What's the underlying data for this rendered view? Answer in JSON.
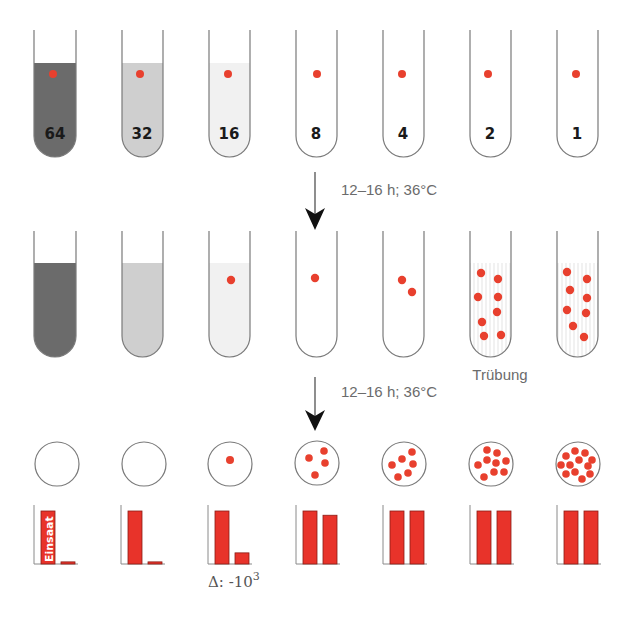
{
  "diagram": {
    "title": "",
    "colors": {
      "bacteria": "#e8402e",
      "bar_fill": "#e8332a",
      "bar_stroke": "#8a1d15",
      "tube_outline": "#7a7a7a",
      "liquid_64": "#6b6b6b",
      "liquid_32": "#cfcfcf",
      "liquid_16": "#f1f1f1",
      "arrow": "#111111",
      "label_grey": "#6b6b6b"
    },
    "row1": {
      "description": "Serial dilution tubes with inoculum (one bacterium each)",
      "tubes": [
        {
          "concentration": "64",
          "liquid": "dark",
          "bacteria": 1
        },
        {
          "concentration": "32",
          "liquid": "medium",
          "bacteria": 1
        },
        {
          "concentration": "16",
          "liquid": "light",
          "bacteria": 1
        },
        {
          "concentration": "8",
          "liquid": "clear",
          "bacteria": 1
        },
        {
          "concentration": "4",
          "liquid": "clear",
          "bacteria": 1
        },
        {
          "concentration": "2",
          "liquid": "clear",
          "bacteria": 1
        },
        {
          "concentration": "1",
          "liquid": "clear",
          "bacteria": 1
        }
      ]
    },
    "arrow1": {
      "label": "12–16 h; 36°C"
    },
    "row2": {
      "description": "Tubes after incubation",
      "tubes": [
        {
          "bacteria": 0,
          "turbid": false
        },
        {
          "bacteria": 0,
          "turbid": false
        },
        {
          "bacteria": 1,
          "turbid": false
        },
        {
          "bacteria": 1,
          "turbid": false
        },
        {
          "bacteria": 2,
          "turbid": false
        },
        {
          "bacteria": 8,
          "turbid": true
        },
        {
          "bacteria": 8,
          "turbid": true
        }
      ],
      "turbidity_label": "Trübung"
    },
    "arrow2": {
      "label": "12–16 h; 36°C"
    },
    "row3": {
      "description": "Plated colonies",
      "dishes": [
        {
          "colonies": 0
        },
        {
          "colonies": 0
        },
        {
          "colonies": 1
        },
        {
          "colonies": 4
        },
        {
          "colonies": 6
        },
        {
          "colonies": 9
        },
        {
          "colonies": 12
        }
      ]
    },
    "row4": {
      "einsaat_label": "Einsaat",
      "delta_label": "Δ: -10",
      "delta_exponent": "3"
    }
  },
  "chart_data": {
    "type": "bar",
    "categories": [
      "64",
      "32",
      "16",
      "8",
      "4",
      "2",
      "1"
    ],
    "series": [
      {
        "name": "Einsaat",
        "values": [
          100,
          100,
          100,
          100,
          100,
          100,
          100
        ]
      },
      {
        "name": "After incubation",
        "values": [
          4,
          4,
          21,
          92,
          100,
          100,
          100
        ]
      }
    ],
    "xlabel": "",
    "ylabel": "",
    "ylim": [
      0,
      110
    ],
    "annotations": [
      "Einsaat",
      "Δ: -10^3"
    ],
    "grid": false
  }
}
